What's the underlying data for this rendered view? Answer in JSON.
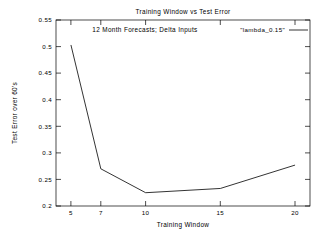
{
  "chart_data": {
    "type": "line",
    "title": "Training Window vs Test Error",
    "subtitle": "12 Month Forecasts; Delta Inputs",
    "xlabel": "Training Window",
    "ylabel": "Test Error over 60's",
    "x": [
      5,
      7,
      10,
      15,
      20
    ],
    "values": [
      0.503,
      0.27,
      0.225,
      0.233,
      0.277
    ],
    "series": [
      {
        "name": "\"lambda_0.15\"",
        "x": [
          5,
          7,
          10,
          15,
          20
        ],
        "values": [
          0.503,
          0.27,
          0.225,
          0.233,
          0.277
        ]
      }
    ],
    "xlim": [
      4,
      21
    ],
    "ylim": [
      0.2,
      0.55
    ],
    "xticks": [
      "5",
      "7",
      "10",
      "15",
      "20"
    ],
    "xtick_values": [
      5,
      7,
      10,
      15,
      20
    ],
    "yticks": [
      "0.2",
      "0.25",
      "0.3",
      "0.35",
      "0.4",
      "0.45",
      "0.5",
      "0.55"
    ],
    "ytick_values": [
      0.2,
      0.25,
      0.3,
      0.35,
      0.4,
      0.45,
      0.5,
      0.55
    ],
    "grid": false,
    "legend": {
      "position": "top-right",
      "entries": [
        {
          "label": "\"lambda_0.15\"",
          "color": "#000000"
        }
      ]
    },
    "line_color": "#000000",
    "background_color": "#ffffff",
    "axis_color": "#000000"
  },
  "legend": {
    "entry_label": "\"lambda_0.15\""
  },
  "axes": {
    "x": {
      "label": "Training Window",
      "tick_0": "5",
      "tick_1": "7",
      "tick_2": "10",
      "tick_3": "15",
      "tick_4": "20"
    },
    "y": {
      "label": "Test Error over 60's",
      "tick_0": "0.2",
      "tick_1": "0.25",
      "tick_2": "0.3",
      "tick_3": "0.35",
      "tick_4": "0.4",
      "tick_5": "0.45",
      "tick_6": "0.5",
      "tick_7": "0.55"
    }
  },
  "header": {
    "title": "Training Window vs Test Error",
    "subtitle": "12 Month Forecasts; Delta Inputs"
  }
}
